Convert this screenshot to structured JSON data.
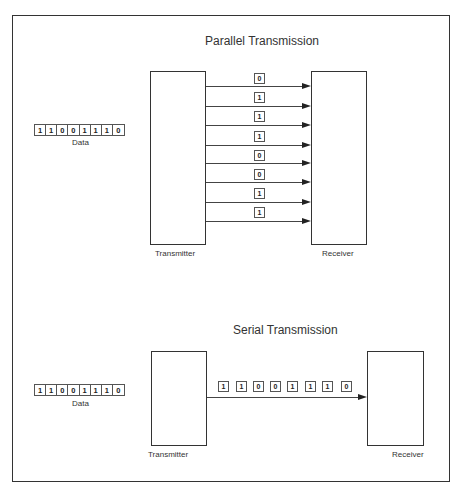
{
  "parallel": {
    "title": "Parallel Transmission",
    "data_label": "Data",
    "data_bits": [
      "1",
      "1",
      "0",
      "0",
      "1",
      "1",
      "1",
      "0"
    ],
    "transmitter_label": "Transmitter",
    "receiver_label": "Receiver",
    "wire_bits": [
      "0",
      "1",
      "1",
      "1",
      "0",
      "0",
      "1",
      "1"
    ]
  },
  "serial": {
    "title": "Serial Transmission",
    "data_label": "Data",
    "data_bits": [
      "1",
      "1",
      "0",
      "0",
      "1",
      "1",
      "1",
      "0"
    ],
    "transmitter_label": "Transmitter",
    "receiver_label": "Receiver",
    "stream_bits": [
      "1",
      "1",
      "0",
      "0",
      "1",
      "1",
      "1",
      "0"
    ]
  },
  "colors": {
    "stroke": "#333333",
    "background": "#ffffff"
  }
}
